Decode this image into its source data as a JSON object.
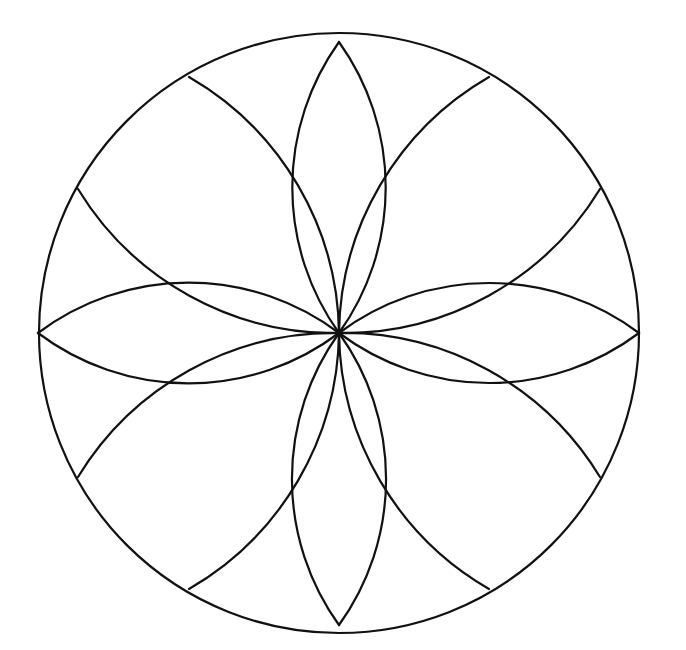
{
  "figure": {
    "type": "geometric-rosette",
    "stroke_color": "#111111",
    "background_color": "#ffffff",
    "outer_circle": {
      "cx": 339,
      "cy": 333,
      "r": 300
    },
    "petal_count": 8
  }
}
